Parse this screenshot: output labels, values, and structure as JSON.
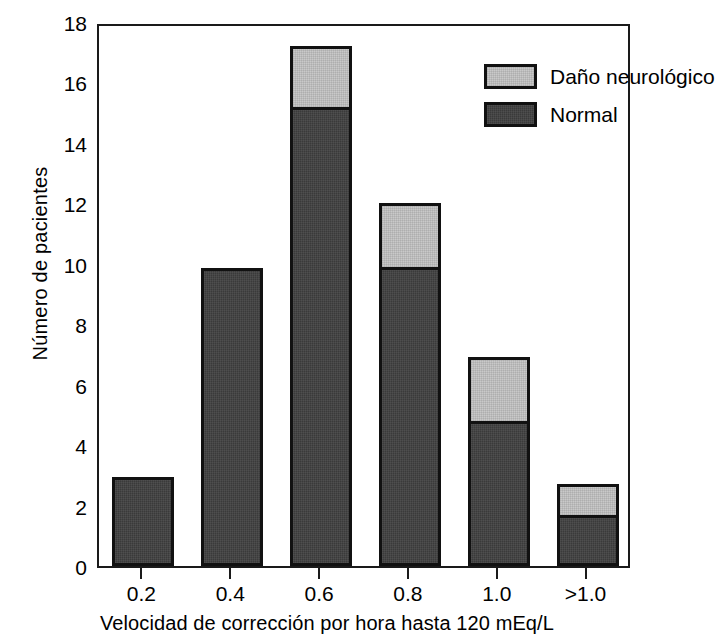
{
  "chart_data": {
    "type": "bar",
    "subtype": "stacked-vertical",
    "title": "",
    "xlabel": "Velocidad de corrección por hora hasta 120 mEq/L",
    "ylabel": "Número de pacientes",
    "categories": [
      "0.2",
      "0.4",
      "0.6",
      "0.8",
      "1.0",
      ">1.0"
    ],
    "series": [
      {
        "name": "Normal",
        "color": "#3a3a3a",
        "values": [
          2.95,
          9.85,
          15.2,
          9.9,
          4.8,
          1.7
        ]
      },
      {
        "name": "Daño neurológico",
        "color": "#c9c9c9",
        "values": [
          0,
          0,
          2.0,
          2.1,
          2.1,
          1.0
        ]
      }
    ],
    "totals": [
      2.95,
      9.85,
      17.2,
      12.0,
      6.9,
      2.7
    ],
    "ylim": [
      0,
      18
    ],
    "yticks": [
      0,
      2,
      4,
      6,
      8,
      10,
      12,
      14,
      16,
      18
    ],
    "ytick_labels": [
      "0",
      "2",
      "4",
      "6",
      "8",
      "10",
      "12",
      "14",
      "16",
      "18"
    ],
    "grid": false,
    "legend_position": "top-right",
    "legend_entries": [
      {
        "label": "Daño neurológico",
        "color": "#c9c9c9"
      },
      {
        "label": "Normal",
        "color": "#3a3a3a"
      }
    ]
  },
  "axes": {
    "y_label": "Número de pacientes",
    "x_label": "Velocidad de corrección por hora hasta 120 mEq/L"
  }
}
